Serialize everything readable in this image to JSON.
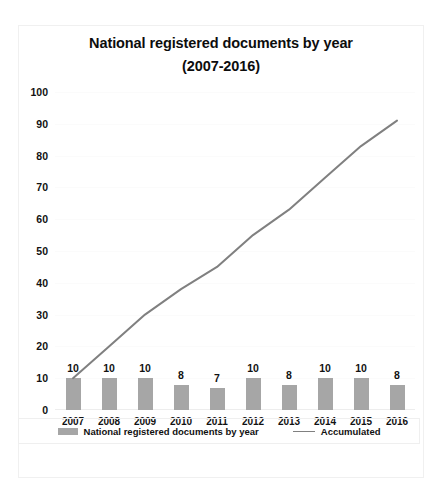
{
  "chart_data": {
    "type": "bar",
    "title": "National registered documents by year (2007-2016)",
    "title_lines": [
      "National registered documents by year",
      "(2007-2016)"
    ],
    "categories": [
      "2007",
      "2008",
      "2009",
      "2010",
      "2011",
      "2012",
      "2013",
      "2014",
      "2015",
      "2016"
    ],
    "series": [
      {
        "name": "National registered documents by year",
        "type": "bar",
        "color": "#a6a6a6",
        "values": [
          10,
          10,
          10,
          8,
          7,
          10,
          8,
          10,
          10,
          8
        ]
      },
      {
        "name": "Accumulated",
        "type": "line",
        "color": "#808080",
        "values": [
          10,
          20,
          30,
          38,
          45,
          55,
          63,
          73,
          83,
          91
        ]
      }
    ],
    "xlabel": "",
    "ylabel": "",
    "ylim": [
      0,
      100
    ],
    "y_ticks": [
      0,
      10,
      20,
      30,
      40,
      50,
      60,
      70,
      80,
      90,
      100
    ],
    "grid": true,
    "legend_position": "bottom"
  },
  "legend": {
    "entries": [
      {
        "label": "National registered documents by year",
        "marker": "bar-swatch"
      },
      {
        "label": "Accumulated",
        "marker": "line-swatch"
      }
    ]
  }
}
